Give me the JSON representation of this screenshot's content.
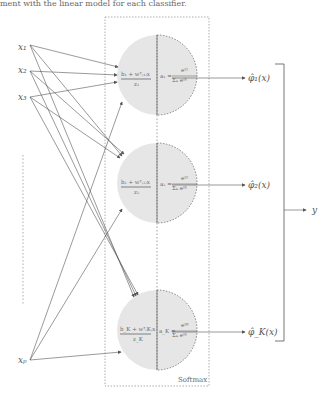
{
  "caption_top": "ment with the linear model for each classifier.",
  "inputs": [
    {
      "label": "x",
      "sub": "1",
      "y": 47
    },
    {
      "label": "x",
      "sub": "2",
      "y": 70
    },
    {
      "label": "x",
      "sub": "3",
      "y": 97
    },
    {
      "label": "x",
      "sub": "p",
      "y": 360
    }
  ],
  "box_label": "Softmax",
  "nodes": [
    {
      "cy": 75,
      "left_top": "b₁ + wᵀ₍₁₎x",
      "left_bot": "z₁",
      "right": "a₁ =",
      "num": "e^{z₁}",
      "den": "Σₖ e^{zₖ}",
      "out": "φ̂₁(x)"
    },
    {
      "cy": 183,
      "left_top": "b₂ + wᵀ₍₂₎x",
      "left_bot": "z₂",
      "right": "a₂ =",
      "num": "e^{z₂}",
      "den": "Σₖ e^{zₖ}",
      "out": "φ̂₂(x)"
    },
    {
      "cy": 330,
      "left_top": "b_K + wᵀ_(K)x",
      "left_bot": "z_K",
      "right": "a_K =",
      "num": "e^{z_K}",
      "den": "Σₖ e^{zₖ}",
      "out": "φ̂_K(x)"
    }
  ],
  "output_label": "y",
  "colors": {
    "node_fill": "#e6e6e6",
    "stroke": "#555555",
    "dotted": "#999999"
  }
}
